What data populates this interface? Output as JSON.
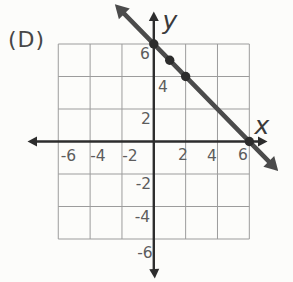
{
  "option_label": "(D)",
  "axes": {
    "x_name": "x",
    "y_name": "y"
  },
  "tick_labels": {
    "x": [
      "-6",
      "-4",
      "-2",
      "2",
      "4",
      "6"
    ],
    "y": [
      "6",
      "4",
      "2",
      "-2",
      "-4",
      "-6"
    ]
  },
  "colors": {
    "background": "#fcfcfa",
    "grid": "#9c9c9c",
    "axis": "#2d2d2d",
    "line": "#4b4b4b",
    "dot": "#2c2c2c",
    "tick_text": "#5d5d5d"
  },
  "chart_data": {
    "type": "line",
    "option_label": "(D)",
    "equation": "y = -x + 6",
    "slope": -1,
    "y_intercept": 6,
    "x_intercept": 6,
    "marked_points": [
      [
        0,
        6
      ],
      [
        1,
        5
      ],
      [
        2,
        4
      ],
      [
        6,
        0
      ]
    ],
    "xlim": [
      -6,
      6
    ],
    "ylim": [
      -6,
      6
    ],
    "x_ticks": [
      -6,
      -4,
      -2,
      2,
      4,
      6
    ],
    "y_ticks": [
      6,
      4,
      2,
      -2,
      -4,
      -6
    ],
    "grid": true,
    "grid_spacing": 2,
    "xlabel": "x",
    "ylabel": "y",
    "line_arrows_both_ends": true,
    "axes_arrows_both_ends": true
  }
}
